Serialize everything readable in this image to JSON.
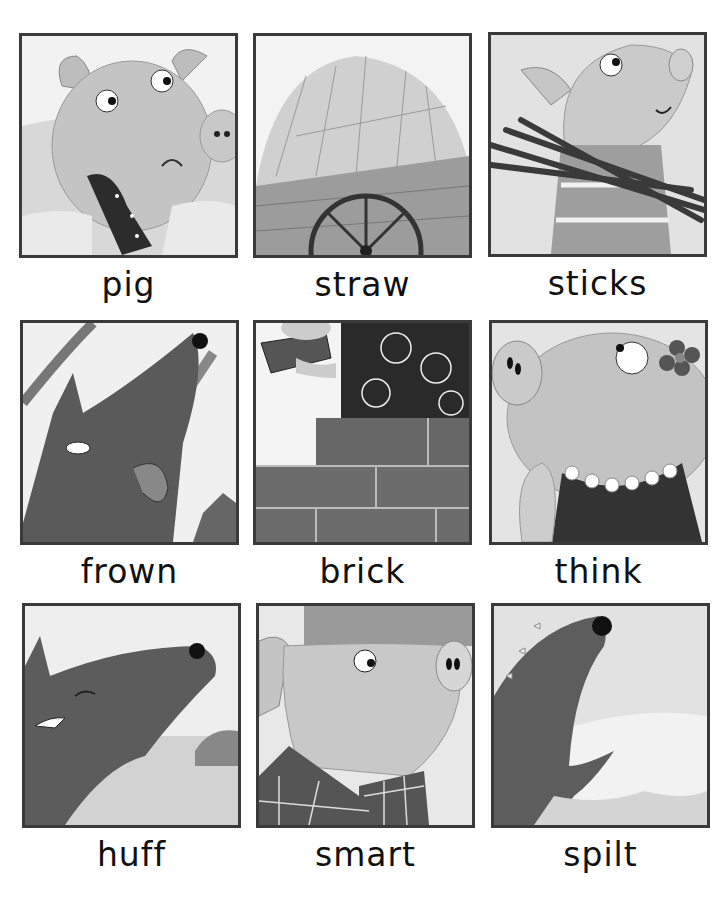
{
  "page": {
    "type": "vocabulary picture cards",
    "layout": {
      "rows": 3,
      "columns": 3
    }
  },
  "cards": [
    {
      "word": "pig",
      "picture": "crying pig holding polka-dot handkerchief"
    },
    {
      "word": "straw",
      "picture": "wooden cart full of straw"
    },
    {
      "word": "sticks",
      "picture": "pig carrying bundle of sticks"
    },
    {
      "word": "frown",
      "picture": "wolf licking lips under tree branches"
    },
    {
      "word": "brick",
      "picture": "hand laying brick with mortar on brick wall"
    },
    {
      "word": "think",
      "picture": "pig with flower looking up thinking"
    },
    {
      "word": "huff",
      "picture": "wolf blowing in a field"
    },
    {
      "word": "smart",
      "picture": "pig in plaid shirt with pot"
    },
    {
      "word": "spilt",
      "picture": "wolf head sticking out of spilt water"
    }
  ],
  "colors": {
    "frame_border": "#3a3a3a",
    "label_text": "#111111",
    "background": "#ffffff"
  }
}
